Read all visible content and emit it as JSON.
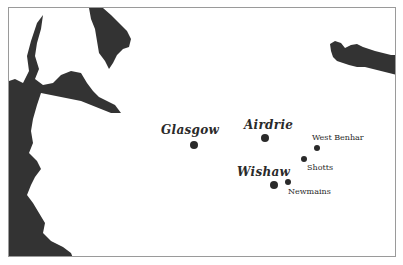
{
  "map": {
    "colors": {
      "water": "#333333",
      "land": "#ffffff",
      "border": "#9a9a9a",
      "marker": "#2a2a2a"
    },
    "towns": [
      {
        "name": "Glasgow",
        "size": "large",
        "dot": [
          193,
          144
        ],
        "label_pos": [
          160,
          122
        ]
      },
      {
        "name": "Airdrie",
        "size": "large",
        "dot": [
          264,
          137
        ],
        "label_pos": [
          243,
          118
        ]
      },
      {
        "name": "Wishaw",
        "size": "large",
        "dot": [
          273,
          184
        ],
        "label_pos": [
          236,
          164
        ]
      },
      {
        "name": "West Benhar",
        "size": "small",
        "dot": [
          316,
          147
        ],
        "label_pos": [
          311,
          132
        ]
      },
      {
        "name": "Shotts",
        "size": "small",
        "dot": [
          303,
          158
        ],
        "label_pos": [
          306,
          162
        ]
      },
      {
        "name": "Newmains",
        "size": "small",
        "dot": [
          287,
          181
        ],
        "label_pos": [
          287,
          186
        ]
      }
    ]
  }
}
